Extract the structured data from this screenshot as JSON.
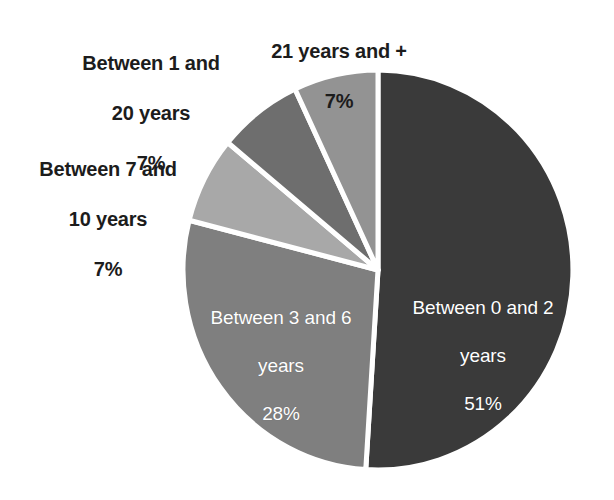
{
  "chart_data": {
    "type": "pie",
    "title": "",
    "subtitle": "",
    "xlabel": "",
    "ylabel": "",
    "legend_position": "none",
    "grid": false,
    "value_unit": "%",
    "start_angle_deg": 0,
    "direction": "clockwise",
    "total": 100,
    "categories": [
      "Between 0 and 2 years",
      "Between 3 and 6 years",
      "Between 7 and 10 years",
      "Between 1 and 20 years",
      "21 years and +"
    ],
    "values": [
      51,
      28,
      7,
      7,
      7
    ],
    "colors": [
      "#3a3a3a",
      "#7f7f7f",
      "#a8a8a8",
      "#6e6e6e",
      "#939393"
    ],
    "slices": [
      {
        "id": "slice-0-2",
        "label": "Between 0 and 2",
        "label_line2": "years",
        "value": 51,
        "value_text": "51%",
        "color": "#3a3a3a",
        "label_placement": "inside",
        "label_color": "#ffffff"
      },
      {
        "id": "slice-3-6",
        "label": "Between 3 and 6",
        "label_line2": "years",
        "value": 28,
        "value_text": "28%",
        "color": "#7f7f7f",
        "label_placement": "inside",
        "label_color": "#ffffff"
      },
      {
        "id": "slice-7-10",
        "label": "Between 7 and",
        "label_line2": "10 years",
        "value": 7,
        "value_text": "7%",
        "color": "#a8a8a8",
        "label_placement": "outside",
        "label_color": "#1c1c1c"
      },
      {
        "id": "slice-1-20",
        "label": "Between 1 and",
        "label_line2": "20 years",
        "value": 7,
        "value_text": "7%",
        "color": "#6e6e6e",
        "label_placement": "outside",
        "label_color": "#1c1c1c"
      },
      {
        "id": "slice-21-plus",
        "label": "21 years and +",
        "label_line2": "",
        "value": 7,
        "value_text": "7%",
        "color": "#939393",
        "label_placement": "outside",
        "label_color": "#1c1c1c"
      }
    ],
    "separator_color": "#ffffff",
    "background_color": "#ffffff"
  }
}
